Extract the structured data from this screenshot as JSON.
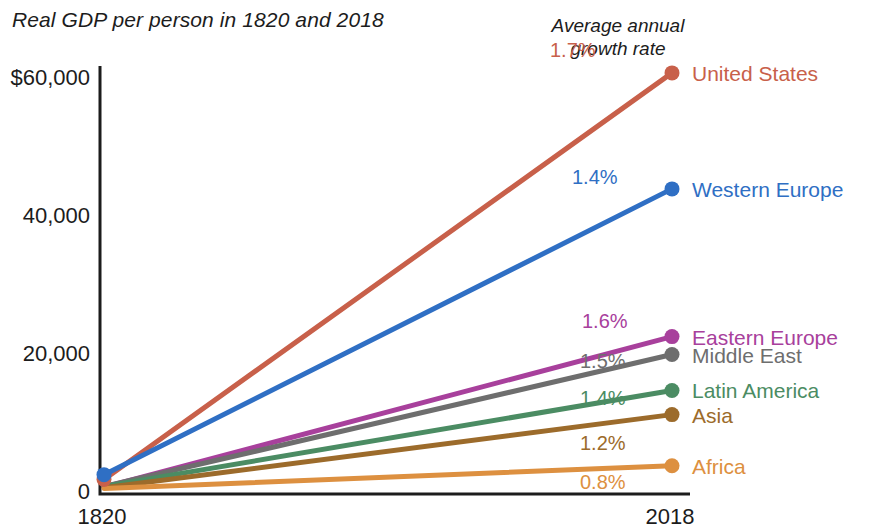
{
  "chart_data": {
    "type": "line",
    "title": "Real GDP per person in 1820 and 2018",
    "annotation_header": "Average annual\ngrowth rate",
    "annotation_header_line1": "Average annual",
    "annotation_header_line2": "growth rate",
    "xlabel": "",
    "ylabel": "",
    "x": [
      1820,
      2018
    ],
    "xtick_labels": [
      "1820",
      "2018"
    ],
    "ytick_labels": [
      "$60,000",
      "40,000",
      "20,000",
      "0"
    ],
    "ytick_values": [
      60000,
      40000,
      20000,
      0
    ],
    "ylim": [
      0,
      62000
    ],
    "grid": false,
    "legend_position": "right-inline",
    "series": [
      {
        "name": "United States",
        "color": "#c8604a",
        "values": [
          2100,
          61000
        ],
        "growth_rate": "1.7%"
      },
      {
        "name": "Western Europe",
        "color": "#2f6fc4",
        "values": [
          2800,
          44200
        ],
        "growth_rate": "1.4%"
      },
      {
        "name": "Eastern Europe",
        "color": "#a8409c",
        "values": [
          1000,
          22800
        ],
        "growth_rate": "1.6%"
      },
      {
        "name": "Middle East",
        "color": "#6e6e6e",
        "values": [
          1100,
          20200
        ],
        "growth_rate": "1.5%"
      },
      {
        "name": "Latin America",
        "color": "#4b8c63",
        "values": [
          1100,
          15000
        ],
        "growth_rate": "1.4%"
      },
      {
        "name": "Asia",
        "color": "#9c6b2b",
        "values": [
          900,
          11500
        ],
        "growth_rate": "1.2%"
      },
      {
        "name": "Africa",
        "color": "#dd9040",
        "values": [
          800,
          4100
        ],
        "growth_rate": "0.8%"
      }
    ],
    "axis_color": "#1c1c1c"
  }
}
